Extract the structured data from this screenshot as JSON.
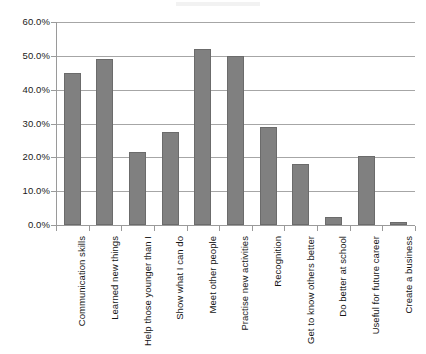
{
  "chart_data": {
    "type": "bar",
    "title": "",
    "subtitle": "",
    "xlabel": "",
    "ylabel": "",
    "ylim": [
      0,
      60
    ],
    "ytick_step": 10,
    "ytick_labels": [
      "0.0%",
      "10.0%",
      "20.0%",
      "30.0%",
      "40.0%",
      "50.0%",
      "60.0%"
    ],
    "ytick_values": [
      0,
      10,
      20,
      30,
      40,
      50,
      60
    ],
    "grid": true,
    "legend": "none",
    "value_suffix": "%",
    "bar_color": "#808080",
    "bar_border_color": "#6b6b6b",
    "gridline_color": "#a6a6a6",
    "axis_color": "#9a9a9a",
    "categories": [
      "Communication skills",
      "Learned new things",
      "Help those younger than I",
      "Show what I can do",
      "Meet other people",
      "Practise new activities",
      "Recognition",
      "Get to know others better",
      "Do better at school",
      "Useful for future career",
      "Create a business"
    ],
    "values": [
      45.0,
      49.0,
      21.5,
      27.5,
      52.0,
      50.0,
      29.0,
      18.0,
      2.3,
      20.5,
      1.0
    ]
  }
}
